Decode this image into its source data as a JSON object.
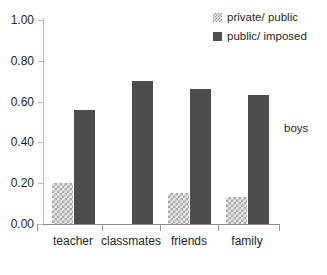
{
  "chart_data": {
    "type": "bar",
    "title": "",
    "subtitle": "",
    "xlabel": "",
    "ylabel": "",
    "ylim": [
      0.0,
      1.0
    ],
    "grid": false,
    "legend_position": "top-right",
    "annotation": "boys",
    "categories": [
      "teacher",
      "classmates",
      "friends",
      "family"
    ],
    "ytick_labels": [
      "1.00",
      "0.80",
      "0.60",
      "0.40",
      "0.20",
      "0.00"
    ],
    "ytick_values": [
      1.0,
      0.8,
      0.6,
      0.4,
      0.2,
      0.0
    ],
    "series": [
      {
        "name": "private/ public",
        "swatch": "checkered-light",
        "color": "#eaeaea",
        "values": [
          0.2,
          0.0,
          0.15,
          0.13
        ]
      },
      {
        "name": "public/ imposed",
        "swatch": "solid-dark",
        "color": "#4d4d4d",
        "values": [
          0.56,
          0.7,
          0.66,
          0.63
        ]
      }
    ]
  },
  "legend": {
    "items": [
      {
        "label": "private/ public"
      },
      {
        "label": "public/ imposed"
      }
    ]
  },
  "side_note": {
    "text": "boys"
  }
}
